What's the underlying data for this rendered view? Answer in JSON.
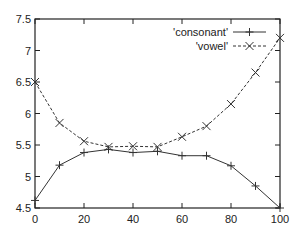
{
  "chart_data": {
    "type": "line",
    "title": "",
    "xlabel": "",
    "ylabel": "",
    "xlim": [
      0,
      100
    ],
    "ylim": [
      4.5,
      7.5
    ],
    "grid": false,
    "legend_position": "top-right",
    "x_ticks": [
      0,
      20,
      40,
      60,
      80,
      100
    ],
    "x_tick_labels": [
      "0",
      "20",
      "40",
      "60",
      "80",
      "100"
    ],
    "y_ticks": [
      4.5,
      5,
      5.5,
      6,
      6.5,
      7,
      7.5
    ],
    "y_tick_labels": [
      "4.5",
      "5",
      "5.5",
      "6",
      "6.5",
      "7",
      "7.5"
    ],
    "x": [
      0,
      10,
      20,
      30,
      40,
      50,
      60,
      70,
      80,
      90,
      100
    ],
    "series": [
      {
        "name": "'consonant'",
        "marker": "plus",
        "line_style": "solid",
        "color": "#333333",
        "values": [
          4.62,
          5.18,
          5.38,
          5.43,
          5.38,
          5.4,
          5.33,
          5.33,
          5.17,
          4.85,
          4.5
        ]
      },
      {
        "name": "'vowel'",
        "marker": "cross",
        "line_style": "dashed",
        "color": "#333333",
        "values": [
          6.5,
          5.85,
          5.56,
          5.47,
          5.48,
          5.47,
          5.63,
          5.8,
          6.15,
          6.65,
          7.2
        ]
      }
    ]
  }
}
